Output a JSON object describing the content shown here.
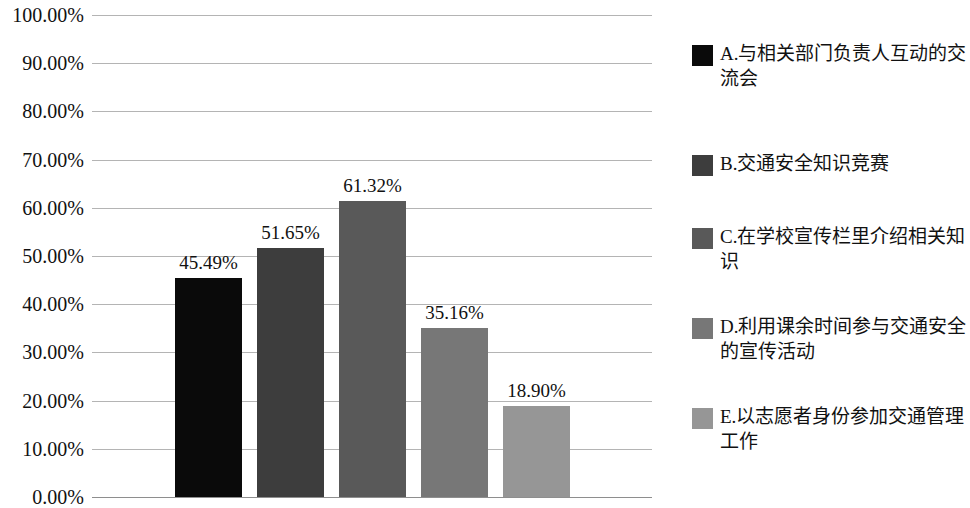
{
  "chart_data": {
    "type": "bar",
    "title": "",
    "subtitle": "",
    "xlabel": "",
    "ylabel": "",
    "ylim": [
      0,
      100
    ],
    "y_unit": "%",
    "grid": true,
    "legend_position": "right",
    "y_ticks": [
      "100.00%",
      "90.00%",
      "80.00%",
      "70.00%",
      "60.00%",
      "50.00%",
      "40.00%",
      "30.00%",
      "20.00%",
      "10.00%",
      "0.00%"
    ],
    "y_tick_values": [
      100,
      90,
      80,
      70,
      60,
      50,
      40,
      30,
      20,
      10,
      0
    ],
    "categories": [
      "A",
      "B",
      "C",
      "D",
      "E"
    ],
    "values": [
      45.49,
      51.65,
      61.32,
      35.16,
      18.9
    ],
    "data_labels": [
      "45.49%",
      "51.65%",
      "61.32%",
      "35.16%",
      "18.90%"
    ],
    "colors": [
      "#0a0a0a",
      "#3d3d3d",
      "#595959",
      "#777777",
      "#969696"
    ],
    "series": [
      {
        "name": "",
        "values": [
          45.49,
          51.65,
          61.32,
          35.16,
          18.9
        ]
      }
    ],
    "legend": [
      "A.与相关部门负责人互动的交流会",
      "B.交通安全知识竞赛",
      "C.在学校宣传栏里介绍相关知识",
      "D.利用课余时间参与交通安全的宣传活动",
      "E.以志愿者身份参加交通管理工作"
    ]
  },
  "legend": {
    "items": [
      {
        "label": "A.与相关部门负责人互动的交流会",
        "color": "#0a0a0a"
      },
      {
        "label": "B.交通安全知识竞赛",
        "color": "#3d3d3d"
      },
      {
        "label": "C.在学校宣传栏里介绍相关知识",
        "color": "#595959"
      },
      {
        "label": "D.利用课余时间参与交通安全的宣传活动",
        "color": "#777777"
      },
      {
        "label": "E.以志愿者身份参加交通管理工作",
        "color": "#969696"
      }
    ]
  }
}
